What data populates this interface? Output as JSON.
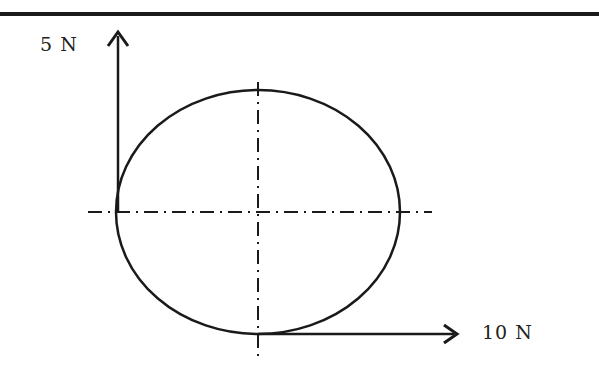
{
  "diagram": {
    "labels": {
      "vertical_force": "5 N",
      "horizontal_force": "10 N"
    },
    "shapes": {
      "ellipse": {
        "cx": 258,
        "cy": 212,
        "rx": 142,
        "ry": 122
      },
      "vertical_arrow": {
        "x": 118,
        "y_from": 212,
        "y_to": 30
      },
      "horizontal_arrow": {
        "y": 334,
        "x_from": 258,
        "x_to": 458
      }
    },
    "colors": {
      "stroke": "#1a1a1a",
      "background": "#ffffff"
    }
  }
}
